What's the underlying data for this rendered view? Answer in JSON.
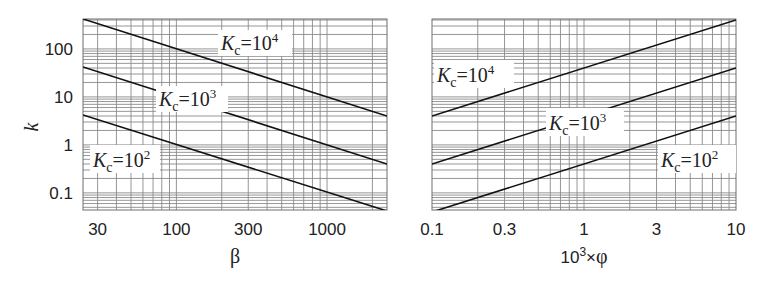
{
  "chart_data": [
    {
      "type": "line",
      "title": "",
      "xlabel": "β",
      "ylabel": "k",
      "xscale": "log",
      "yscale": "log",
      "xlim": [
        24,
        2500
      ],
      "ylim": [
        0.044,
        420
      ],
      "grid": true,
      "legend_position": "inline labels",
      "x_ticks": [
        30,
        100,
        300,
        1000
      ],
      "x_tick_labels": [
        "30",
        "100",
        "300",
        "1000"
      ],
      "y_ticks": [
        0.1,
        1,
        10,
        100
      ],
      "y_tick_labels": [
        "0.1",
        "1",
        "10",
        "100"
      ],
      "series": [
        {
          "name": "Kc=10^4",
          "label_base": "K",
          "label_sub": "c",
          "label_eq": "=10",
          "label_sup": "4",
          "x": [
            24,
            2500
          ],
          "values": [
            420,
            4.0
          ]
        },
        {
          "name": "Kc=10^3",
          "label_base": "K",
          "label_sub": "c",
          "label_eq": "=10",
          "label_sup": "3",
          "x": [
            24,
            2500
          ],
          "values": [
            42,
            0.4
          ]
        },
        {
          "name": "Kc=10^2",
          "label_base": "K",
          "label_sub": "c",
          "label_eq": "=10",
          "label_sup": "2",
          "x": [
            24,
            2500
          ],
          "values": [
            4.2,
            0.042
          ]
        }
      ]
    },
    {
      "type": "line",
      "title": "",
      "xlabel": "10³×φ",
      "ylabel": "k",
      "xscale": "log",
      "yscale": "log",
      "xlim": [
        0.1,
        10
      ],
      "ylim": [
        0.044,
        420
      ],
      "grid": true,
      "legend_position": "inline labels",
      "x_ticks": [
        0.1,
        0.3,
        1,
        3,
        10
      ],
      "x_tick_labels": [
        "0.1",
        "0.3",
        "1",
        "3",
        "10"
      ],
      "y_ticks": [],
      "y_tick_labels": [],
      "series": [
        {
          "name": "Kc=10^4",
          "label_base": "K",
          "label_sub": "c",
          "label_eq": "=10",
          "label_sup": "4",
          "x": [
            0.1,
            10
          ],
          "values": [
            4.0,
            400
          ]
        },
        {
          "name": "Kc=10^3",
          "label_base": "K",
          "label_sub": "c",
          "label_eq": "=10",
          "label_sup": "3",
          "x": [
            0.1,
            10
          ],
          "values": [
            0.4,
            40
          ]
        },
        {
          "name": "Kc=10^2",
          "label_base": "K",
          "label_sub": "c",
          "label_eq": "=10",
          "label_sup": "2",
          "x": [
            0.1,
            10
          ],
          "values": [
            0.04,
            4
          ]
        }
      ]
    }
  ],
  "layout": {
    "panels": [
      {
        "x0": 83,
        "x1": 387,
        "y0": 19,
        "y1": 210,
        "label_boxes": [
          {
            "x": 218,
            "y": 30,
            "w": 74,
            "h": 26
          },
          {
            "x": 156,
            "y": 86,
            "w": 72,
            "h": 26
          },
          {
            "x": 90,
            "y": 145,
            "w": 70,
            "h": 28
          }
        ]
      },
      {
        "x0": 432,
        "x1": 736,
        "y0": 19,
        "y1": 210,
        "label_boxes": [
          {
            "x": 434,
            "y": 60,
            "w": 80,
            "h": 28
          },
          {
            "x": 546,
            "y": 108,
            "w": 78,
            "h": 28
          },
          {
            "x": 658,
            "y": 145,
            "w": 78,
            "h": 28
          }
        ]
      }
    ],
    "colors": {
      "grid": "#8a8a8a",
      "frame": "#6f6f6f",
      "curve": "#111111",
      "background": "#ffffff"
    }
  }
}
